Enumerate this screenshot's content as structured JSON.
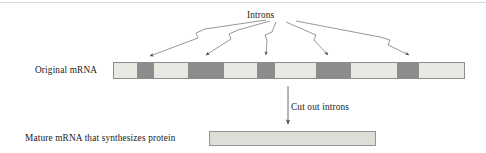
{
  "figure": {
    "labels": {
      "introns": "Introns",
      "original_mrna": "Original mRNA",
      "cut_out_introns": "Cut out introns",
      "mature_mrna": "Mature mRNA that synthesizes protein"
    },
    "colors": {
      "exon": "#e9e9e4",
      "intron": "#8c8c8c",
      "bar_border": "#8c8c8c",
      "mature_fill": "#dedeD9",
      "mature_border": "#949494",
      "arrow": "#4d4d4d",
      "text": "#1a1a1a"
    }
  },
  "chart_data": {
    "type": "diagram",
    "title": "Introns",
    "original_mrna": {
      "label": "Original mRNA",
      "total_width_px": 352,
      "segments": [
        {
          "kind": "exon",
          "width_px": 23,
          "color": "#e9e9e4"
        },
        {
          "kind": "intron",
          "width_px": 17,
          "color": "#8c8c8c"
        },
        {
          "kind": "exon",
          "width_px": 34,
          "color": "#e9e9e4"
        },
        {
          "kind": "intron",
          "width_px": 36,
          "color": "#8c8c8c"
        },
        {
          "kind": "exon",
          "width_px": 33,
          "color": "#e9e9e4"
        },
        {
          "kind": "intron",
          "width_px": 18,
          "color": "#8c8c8c"
        },
        {
          "kind": "exon",
          "width_px": 41,
          "color": "#e9e9e4"
        },
        {
          "kind": "intron",
          "width_px": 35,
          "color": "#8c8c8c"
        },
        {
          "kind": "exon",
          "width_px": 46,
          "color": "#e9e9e4"
        },
        {
          "kind": "intron",
          "width_px": 22,
          "color": "#8c8c8c"
        },
        {
          "kind": "exon",
          "width_px": 45,
          "color": "#e9e9e4"
        }
      ],
      "intron_count": 5,
      "exon_count": 6
    },
    "mature_mrna": {
      "label": "Mature mRNA that synthesizes protein",
      "width_px": 167,
      "segments": [
        {
          "kind": "exon",
          "width_px": 167,
          "color": "#dedeD9"
        }
      ]
    },
    "annotations": [
      {
        "text": "Introns",
        "points_to": "5 dark intron segments of the original mRNA",
        "arrow_count": 5
      },
      {
        "text": "Cut out introns",
        "points_to": "mature mRNA",
        "arrow_count": 1
      }
    ],
    "arrows": [
      {
        "from_x": 268,
        "from_y": 22,
        "to_x": 150,
        "to_y": 58,
        "label": "Introns"
      },
      {
        "from_x": 272,
        "from_y": 22,
        "to_x": 206,
        "to_y": 58,
        "label": "Introns"
      },
      {
        "from_x": 277,
        "from_y": 22,
        "to_x": 265,
        "to_y": 58,
        "label": "Introns"
      },
      {
        "from_x": 287,
        "from_y": 22,
        "to_x": 327,
        "to_y": 58,
        "label": "Introns"
      },
      {
        "from_x": 296,
        "from_y": 22,
        "to_x": 408,
        "to_y": 58,
        "label": "Introns"
      },
      {
        "from_x": 288,
        "from_y": 87,
        "to_x": 288,
        "to_y": 125,
        "label": "Cut out introns"
      }
    ],
    "xlabel": "",
    "ylabel": "",
    "grid": false,
    "legend": null
  }
}
